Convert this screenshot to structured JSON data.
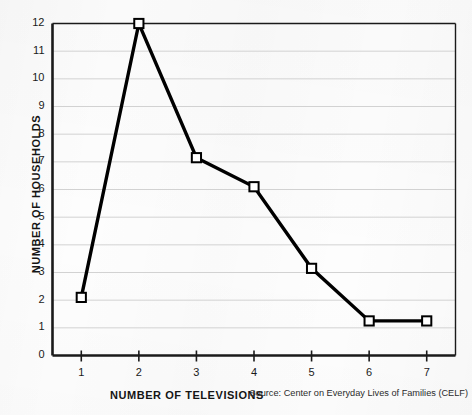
{
  "figure": {
    "y_axis_title": "NUMBER OF HOUSEHOLDS",
    "x_axis_title": "NUMBER OF TELEVISIONS",
    "source_note": "Source: Center on Everyday Lives of Families (CELF)"
  },
  "colors": {
    "line": "#000000",
    "marker_fill": "#ffffff",
    "marker_stroke": "#000000",
    "gridline": "#d2d2d2",
    "axis": "#1a1a1a",
    "background": "#fdfdfd",
    "text": "#151515"
  },
  "chart_data": {
    "type": "line",
    "title": "",
    "subtitle": "",
    "xlabel": "NUMBER OF TELEVISIONS",
    "ylabel": "NUMBER OF HOUSEHOLDS",
    "x": [
      1,
      2,
      3,
      4,
      5,
      6,
      7
    ],
    "values": [
      2.1,
      12.0,
      7.15,
      6.1,
      3.15,
      1.25,
      1.25
    ],
    "series": [
      {
        "name": "Number of households",
        "values": [
          2.1,
          12.0,
          7.15,
          6.1,
          3.15,
          1.25,
          1.25
        ]
      }
    ],
    "xlim": [
      0.5,
      7.5
    ],
    "ylim": [
      0,
      12
    ],
    "xticks": [
      1,
      2,
      3,
      4,
      5,
      6,
      7
    ],
    "xtick_labels": [
      "1",
      "2",
      "3",
      "4",
      "5",
      "6",
      "7"
    ],
    "yticks": [
      0,
      1,
      2,
      3,
      4,
      5,
      6,
      7,
      8,
      9,
      10,
      11,
      12
    ],
    "ytick_labels": [
      "0",
      "1",
      "2",
      "3",
      "4",
      "5",
      "6",
      "7",
      "8",
      "9",
      "10",
      "11",
      "12"
    ],
    "grid": true,
    "grid_axis": "y",
    "legend": false,
    "legend_position": "none",
    "marker": "square-open",
    "annotations": [
      "Source: Center on Everyday Lives of Families (CELF)"
    ]
  }
}
